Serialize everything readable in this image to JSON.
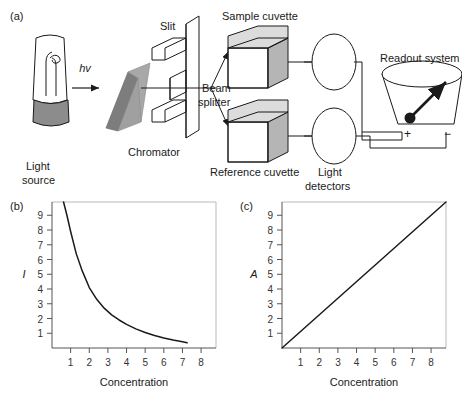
{
  "panels": {
    "a": {
      "id": "(a)",
      "title": "Spectrophotometer schematic"
    },
    "b": {
      "id": "(b)"
    },
    "c": {
      "id": "(c)"
    }
  },
  "diagram": {
    "light_source_label_line1": "Light",
    "light_source_label_line2": "source",
    "photon_label": "hv",
    "chromator_label": "Chromator",
    "slit_label": "Slit",
    "beam_splitter_line1": "Beam",
    "beam_splitter_line2": "splitter",
    "sample_cuvette_label": "Sample cuvette",
    "reference_cuvette_label": "Reference cuvette",
    "detectors_line1": "Light",
    "detectors_line2": "detectors",
    "readout_label": "Readout system",
    "terminal_positive": "+",
    "terminal_negative": "−",
    "colors": {
      "ink": "#1a1a1a",
      "prism_light": "#a8a8a8",
      "prism_dark": "#7d7d7d",
      "cube_face_side": "#b5b5b5",
      "cube_face_top": "#dcdcdc",
      "lamp_base": "#8c8c8c",
      "frame_light": "#b9b9b9"
    }
  },
  "chart_data": [
    {
      "type": "line",
      "panel": "(b)",
      "title": "",
      "xlabel": "Concentration",
      "ylabel": "I",
      "xticks": [
        1,
        2,
        3,
        4,
        5,
        6,
        7,
        8
      ],
      "yticks": [
        1,
        2,
        3,
        4,
        5,
        6,
        7,
        8,
        9
      ],
      "xlim": [
        0,
        8.8
      ],
      "ylim": [
        0,
        9.9
      ],
      "grid": false,
      "legend": "none",
      "curve": "exponential-decay",
      "x": [
        0.62,
        0.8,
        1.0,
        1.3,
        1.6,
        2.0,
        2.4,
        2.8,
        3.2,
        3.6,
        4.0,
        4.5,
        5.0,
        5.5,
        6.0,
        6.5,
        7.0,
        7.25
      ],
      "y": [
        9.9,
        9.0,
        7.9,
        6.4,
        5.3,
        4.1,
        3.3,
        2.7,
        2.25,
        1.9,
        1.6,
        1.3,
        1.05,
        0.85,
        0.68,
        0.54,
        0.42,
        0.35
      ]
    },
    {
      "type": "line",
      "panel": "(c)",
      "title": "",
      "xlabel": "Concentration",
      "ylabel": "A",
      "xticks": [
        1,
        2,
        3,
        4,
        5,
        6,
        7,
        8
      ],
      "yticks": [
        1,
        2,
        3,
        4,
        5,
        6,
        7,
        8,
        9
      ],
      "xlim": [
        0,
        8.8
      ],
      "ylim": [
        0,
        9.9
      ],
      "grid": false,
      "legend": "none",
      "curve": "linear",
      "x": [
        0,
        8.8
      ],
      "y": [
        0,
        9.9
      ]
    }
  ]
}
